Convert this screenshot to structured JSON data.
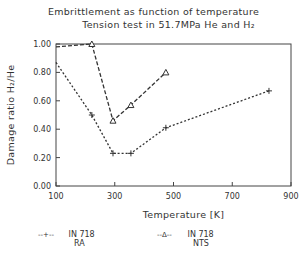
{
  "chart_data": {
    "type": "line",
    "title": "Embrittlement as function of temperature",
    "subtitle": "Tension test in 51.7MPa He and H2",
    "xlabel": "Temperature [K]",
    "ylabel": "Damage ratio H2/He",
    "xlim": [
      100,
      900
    ],
    "ylim": [
      0.0,
      1.0
    ],
    "x_ticks": [
      "100",
      "300",
      "500",
      "700",
      "900"
    ],
    "y_ticks": [
      "0.00",
      "0.20",
      "0.40",
      "0.60",
      "0.80",
      "1.00"
    ],
    "grid": false,
    "legend_position": "bottom",
    "series": [
      {
        "name": "IN 718 RA",
        "marker": "+",
        "linestyle": "dotted",
        "x": [
          100,
          222,
          294,
          355,
          474,
          825
        ],
        "values": [
          0.87,
          0.5,
          0.23,
          0.23,
          0.41,
          0.67
        ]
      },
      {
        "name": "IN 718 NTS",
        "marker": "triangle",
        "linestyle": "dashed",
        "x": [
          100,
          222,
          294,
          355,
          474
        ],
        "values": [
          0.98,
          1.0,
          0.46,
          0.57,
          0.8
        ]
      }
    ]
  },
  "title": {
    "line1": "Embrittlement as function of temperature",
    "line2": "Tension test in 51.7MPa He and H₂"
  },
  "axes": {
    "xlabel": "Temperature [K]",
    "ylabel": "Damage ratio H₂/He"
  },
  "legend": {
    "ra": {
      "marker": "--+--",
      "line1": "IN 718",
      "line2": "RA"
    },
    "nts": {
      "marker": "--Δ--",
      "line1": "IN 718",
      "line2": "NTS"
    }
  }
}
